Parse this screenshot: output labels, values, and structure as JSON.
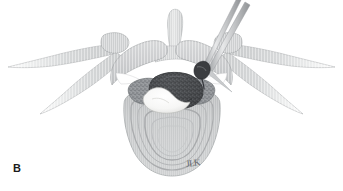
{
  "figure": {
    "panel_label": "B",
    "artist_signature": "JLK",
    "background_color": "#ffffff",
    "colors": {
      "bone_light": "#d8d9da",
      "bone_mid": "#c3c5c6",
      "bone_dark": "#a9abad",
      "bone_outline": "#8c8f92",
      "rib_fade": "#cfd1d2",
      "facet_stipple": "#8e9195",
      "cord_dark": "#4a4c4f",
      "disc_white": "#fbfbfa",
      "instrument_shaft": "#bcbec0",
      "instrument_tip": "#3b3d40",
      "label_color": "#1b1b1b"
    },
    "parts": [
      {
        "name": "spinous-process",
        "shade": "#dcdddd"
      },
      {
        "name": "left-lamina",
        "shade": "#cccecf"
      },
      {
        "name": "right-lamina",
        "shade": "#cccecf"
      },
      {
        "name": "left-transverse-process-rib",
        "shade": "#d2d4d5"
      },
      {
        "name": "right-transverse-process-rib",
        "shade": "#d2d4d5"
      },
      {
        "name": "left-articular-process",
        "shade": "#8e9195"
      },
      {
        "name": "right-articular-process",
        "shade": "#8e9195"
      },
      {
        "name": "spinal-cord-dura-mass",
        "shade": "#4a4c4f"
      },
      {
        "name": "herniated-disc-fragment",
        "shade": "#fbfbfa"
      },
      {
        "name": "vertebral-body",
        "shade": "#c5c7c8"
      },
      {
        "name": "vertebral-body-rings",
        "shade": "#b4b6b8"
      },
      {
        "name": "instrument-probe",
        "shade": "#bcbec0"
      },
      {
        "name": "instrument-rongeur",
        "shade": "#bcbec0"
      },
      {
        "name": "instrument-tip-jaws",
        "shade": "#3b3d40"
      }
    ]
  }
}
